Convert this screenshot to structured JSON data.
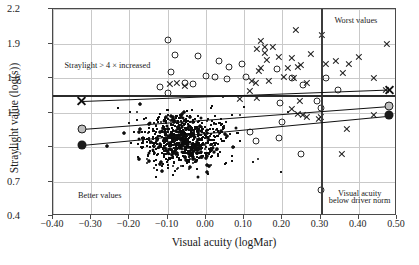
{
  "chart_data": {
    "type": "scatter",
    "title": "",
    "xlabel": "Visual acuity (logMar)",
    "ylabel": "Straylight value (log(s))",
    "xlim": [
      -0.4,
      0.5
    ],
    "ylim": [
      0.4,
      2.2
    ],
    "xticks": [
      "−0.40",
      "−0.30",
      "−0.20",
      "−0.10",
      "0.00",
      "0.10",
      "0.20",
      "0.30",
      "0.40",
      "0.50"
    ],
    "xtick_values": [
      -0.4,
      -0.3,
      -0.2,
      -0.1,
      0.0,
      0.1,
      0.2,
      0.3,
      0.4,
      0.5
    ],
    "yticks": [
      "2.2",
      "1.9",
      "1.6",
      "1.3",
      "1",
      "0.7",
      "0.4"
    ],
    "ytick_values": [
      2.2,
      1.9,
      1.6,
      1.3,
      1.0,
      0.7,
      0.4
    ],
    "grid": true,
    "legend": "none",
    "annotations": [
      {
        "text": "Straylight > 4 × increased",
        "x": -0.255,
        "y": 1.7
      },
      {
        "text": "Worst values",
        "x": 0.395,
        "y": 2.09
      },
      {
        "text": "Better values",
        "x": -0.275,
        "y": 0.565
      },
      {
        "text": "Visual acuity",
        "x": 0.405,
        "y": 0.585
      },
      {
        "text": "below driver norm",
        "x": 0.405,
        "y": 0.525
      }
    ],
    "reference_lines": [
      {
        "orientation": "vertical",
        "value": 0.3,
        "style": "thick",
        "label": "driver norm limit"
      },
      {
        "orientation": "horizontal",
        "value": 1.45,
        "style": "thick",
        "label": "straylight 4x increased"
      }
    ],
    "trend_lines": [
      {
        "name": "upper-percentile",
        "marker": "x",
        "x0": -0.325,
        "y0": 1.4,
        "x1": 0.48,
        "y1": 1.5
      },
      {
        "name": "mid-percentile",
        "marker": "open-circle",
        "x0": -0.325,
        "y0": 1.16,
        "x1": 0.48,
        "y1": 1.36
      },
      {
        "name": "lower-percentile",
        "marker": "filled-circle",
        "x0": -0.325,
        "y0": 1.02,
        "x1": 0.48,
        "y1": 1.275
      }
    ],
    "series": [
      {
        "name": "individual eyes",
        "marker": "small-dot",
        "n_points": 2100,
        "description": "dense cloud centred near (-0.05, 1.05), spreading from x=-0.33 to 0.50 and y=0.45 to 1.95"
      },
      {
        "name": "outlier-crosses",
        "marker": "x",
        "points": [
          [
            0.235,
            2.02
          ],
          [
            0.305,
            1.97
          ],
          [
            0.145,
            1.92
          ],
          [
            0.475,
            1.9
          ],
          [
            0.155,
            1.87
          ],
          [
            0.175,
            1.87
          ],
          [
            0.135,
            1.85
          ],
          [
            0.155,
            1.82
          ],
          [
            0.275,
            1.81
          ],
          [
            0.4,
            1.78
          ],
          [
            0.16,
            1.76
          ],
          [
            0.225,
            1.77
          ],
          [
            0.34,
            1.75
          ],
          [
            0.19,
            1.78
          ],
          [
            0.375,
            1.72
          ],
          [
            0.315,
            1.72
          ],
          [
            0.24,
            1.7
          ],
          [
            0.25,
            1.71
          ],
          [
            0.215,
            1.69
          ],
          [
            0.145,
            1.69
          ],
          [
            0.14,
            1.66
          ],
          [
            0.36,
            1.64
          ],
          [
            0.44,
            1.6
          ],
          [
            0.47,
            1.5
          ],
          [
            0.205,
            1.61
          ],
          [
            0.23,
            1.6
          ],
          [
            0.265,
            1.56
          ],
          [
            0.165,
            1.57
          ],
          [
            0.13,
            1.56
          ],
          [
            0.12,
            1.57
          ],
          [
            -0.075,
            1.56
          ],
          [
            -0.095,
            1.55
          ],
          [
            -0.055,
            1.53
          ],
          [
            0.115,
            1.49
          ],
          [
            0.135,
            1.43
          ],
          [
            0.09,
            1.42
          ],
          [
            0.245,
            1.4
          ],
          [
            0.225,
            1.33
          ],
          [
            0.24,
            1.29
          ],
          [
            0.255,
            1.28
          ],
          [
            0.265,
            1.26
          ],
          [
            0.44,
            1.28
          ],
          [
            0.3,
            1.26
          ],
          [
            0.295,
            1.24
          ],
          [
            0.37,
            1.16
          ],
          [
            0.355,
            0.94
          ],
          [
            -0.325,
            1.4
          ]
        ]
      },
      {
        "name": "outlier-circles",
        "marker": "open-circle",
        "points": [
          [
            -0.1,
            1.93
          ],
          [
            -0.08,
            1.8
          ],
          [
            -0.02,
            1.79
          ],
          [
            0.035,
            1.75
          ],
          [
            0.06,
            1.7
          ],
          [
            0.095,
            1.72
          ],
          [
            -0.09,
            1.65
          ],
          [
            -0.055,
            1.56
          ],
          [
            -0.035,
            1.55
          ],
          [
            0.0,
            1.62
          ],
          [
            0.025,
            1.61
          ],
          [
            0.055,
            1.59
          ],
          [
            0.105,
            1.61
          ],
          [
            0.185,
            1.68
          ],
          [
            0.225,
            1.6
          ],
          [
            0.255,
            1.54
          ],
          [
            0.315,
            1.6
          ],
          [
            0.345,
            1.5
          ],
          [
            0.29,
            1.4
          ],
          [
            0.3,
            1.34
          ],
          [
            0.195,
            1.38
          ],
          [
            0.2,
            1.22
          ],
          [
            0.19,
            1.08
          ],
          [
            0.13,
            1.05
          ],
          [
            0.115,
            1.13
          ],
          [
            0.25,
            0.94
          ],
          [
            0.3,
            0.63
          ],
          [
            -0.1,
            1.47
          ],
          [
            -0.12,
            1.52
          ]
        ]
      }
    ]
  },
  "figure": {
    "xlabel": "Visual acuity (logMar)",
    "ylabel": "Straylight value (log(s))",
    "anno_straylight": "Straylight > 4 × increased",
    "anno_worst": "Worst values",
    "anno_better": "Better values",
    "anno_acuity_l1": "Visual acuity",
    "anno_acuity_l2": "below driver norm"
  }
}
